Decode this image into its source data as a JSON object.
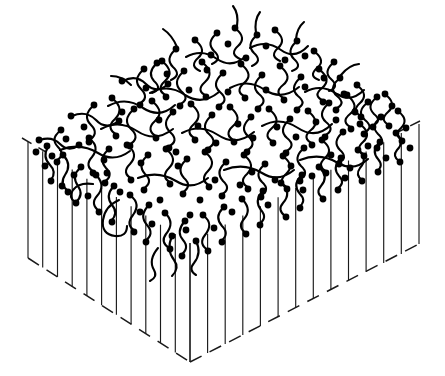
{
  "figure": {
    "domain_kind": "Diagram",
    "background_color": "#ffffff",
    "ink_color": "#000000",
    "line_color": "#1a1a1a",
    "caption": ""
  },
  "chart_data": {
    "type": "diagram",
    "subtitle": "",
    "xlabel": "",
    "ylabel": "",
    "legend": [],
    "annotations": [],
    "grid": false,
    "style": {
      "bead_radius_px": 3.4,
      "chain_stroke_px": 2.1,
      "tether_stroke_px": 1.15,
      "bead_count": 178,
      "chain_count": 96,
      "tether_count": 23
    },
    "geometry": {
      "projection": "isometric",
      "slab_top_face": {
        "left": [
          28,
          142
        ],
        "back": [
          214,
          34
        ],
        "right": [
          420,
          121
        ],
        "front": [
          190,
          238
        ]
      },
      "slab_depth_px": 120,
      "bottom_edge_dashed": true,
      "bottom_front_vertex": [
        190,
        362
      ],
      "bottom_left_vertex": [
        28,
        258
      ],
      "bottom_right_vertex": [
        419,
        244
      ]
    },
    "tether_lines": {
      "left_face_count": 11,
      "right_face_count": 12,
      "orientation": "vertical",
      "top_anchor_edge": "top face front edges",
      "bottom_anchor_edge": "dashed base"
    },
    "polymer_layer": {
      "fill": "dense entangled coils",
      "terminal_group": "filled circle",
      "vertical_extent_px": [
        4,
        255
      ]
    }
  }
}
